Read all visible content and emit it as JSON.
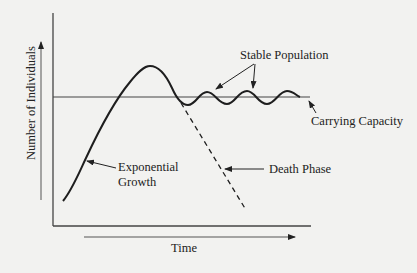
{
  "diagram": {
    "axes": {
      "x_label": "Time",
      "y_label": "Number of Individuals"
    },
    "labels": {
      "stable_population": "Stable Population",
      "carrying_capacity": "Carrying Capacity",
      "exponential_growth_line1": "Exponential",
      "exponential_growth_line2": "Growth",
      "death_phase": "Death Phase"
    },
    "colors": {
      "background": "#f2f2f0",
      "ink": "#222222",
      "axis": "#444444"
    }
  }
}
